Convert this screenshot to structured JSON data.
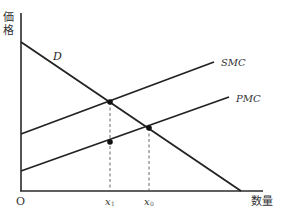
{
  "diagram": {
    "type": "economics-supply-demand",
    "y_axis_label_line1": "価",
    "y_axis_label_line2": "格",
    "x_axis_label": "数量",
    "origin_label": "O",
    "curves": [
      {
        "name": "D",
        "label": "D",
        "from": [
          21,
          42
        ],
        "to": [
          241,
          190
        ]
      },
      {
        "name": "SMC",
        "label": "SMC",
        "from": [
          21,
          134
        ],
        "to": [
          214,
          62
        ]
      },
      {
        "name": "PMC",
        "label": "PMC",
        "from": [
          21,
          170
        ],
        "to": [
          229,
          97
        ]
      }
    ],
    "points": [
      {
        "name": "D-SMC-intersection",
        "x": 110,
        "y": 102
      },
      {
        "name": "D-PMC-intersection",
        "x": 149,
        "y": 128
      },
      {
        "name": "PMC-at-x1",
        "x": 110,
        "y": 137
      }
    ],
    "x_ticks": [
      {
        "label": "x",
        "subscript": "1",
        "x": 110
      },
      {
        "label": "x",
        "subscript": "0",
        "x": 149
      }
    ],
    "colors": {
      "line": "#222222",
      "axis": "#2a2a2a",
      "background": "#ffffff"
    }
  }
}
